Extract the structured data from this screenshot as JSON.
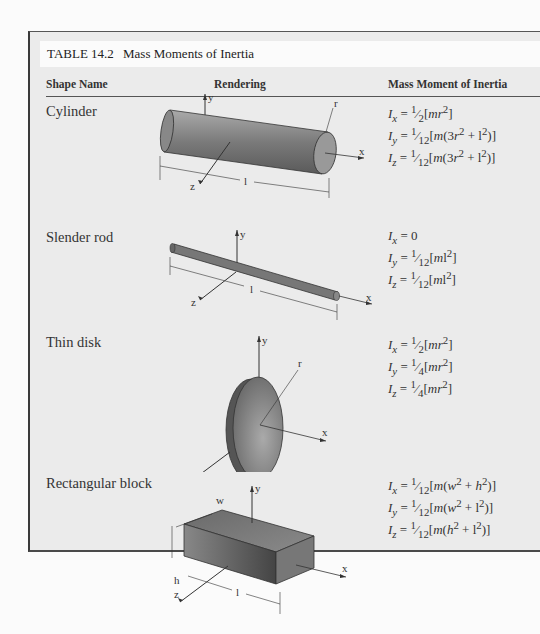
{
  "table": {
    "number": "TABLE 14.2",
    "title": "Mass Moments of Inertia",
    "columns": [
      "Shape Name",
      "Rendering",
      "Mass Moment of Inertia"
    ],
    "rows": [
      {
        "shape": "Cylinder",
        "figure_labels": {
          "y": "y",
          "x": "x",
          "z": "z",
          "r": "r",
          "l": "l"
        },
        "formulas": [
          "Ix = 1/2[mr²]",
          "Iy = 1/12[m(3r² + l²)]",
          "Iz = 1/12[m(3r² + l²)]"
        ]
      },
      {
        "shape": "Slender rod",
        "figure_labels": {
          "y": "y",
          "x": "x",
          "z": "z",
          "l": "l"
        },
        "formulas": [
          "Ix = 0",
          "Iy = 1/12[ml²]",
          "Iz = 1/12[ml²]"
        ]
      },
      {
        "shape": "Thin disk",
        "figure_labels": {
          "y": "y",
          "x": "x",
          "z": "z",
          "r": "r"
        },
        "formulas": [
          "Ix = 1/2[mr²]",
          "Iy = 1/4[mr²]",
          "Iz = 1/4[mr²]"
        ]
      },
      {
        "shape": "Rectangular block",
        "figure_labels": {
          "y": "y",
          "x": "x",
          "z": "z",
          "w": "w",
          "h": "h",
          "l": "l"
        },
        "formulas": [
          "Ix = 1/12[m(w² + h²)]",
          "Iy = 1/12[m(w² + l²)]",
          "Iz = 1/12[m(h² + l²)]"
        ]
      }
    ]
  }
}
